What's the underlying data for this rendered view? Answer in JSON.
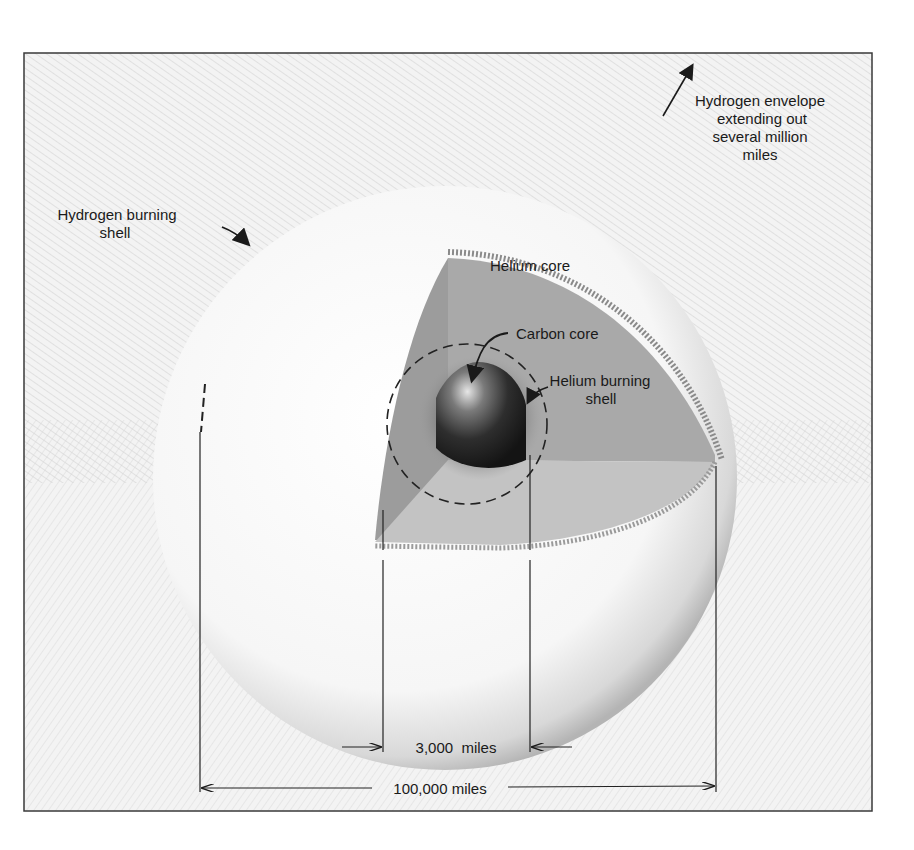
{
  "diagram": {
    "labels": {
      "hydrogen_envelope": [
        "Hydrogen envelope",
        "extending out",
        "several million",
        "miles"
      ],
      "hydrogen_shell": [
        "Hydrogen burning",
        "shell"
      ],
      "helium_core": "Helium core",
      "carbon_core": "Carbon core",
      "helium_shell": [
        "Helium burning",
        "shell"
      ]
    },
    "dimensions": {
      "inner": "3,000  miles",
      "outer": "100,000 miles"
    },
    "colors": {
      "frame": "#3a3a3a",
      "background": "#f4f4f4",
      "hatch": "#bdbdbd",
      "sphere_light": "#fafafa",
      "sphere_edge": "#a8a8a8",
      "cut_face_dark": "#9a9a9a",
      "cut_face_mid": "#aaaaaa",
      "cut_face_light": "#c2c2c2",
      "carbon_core": "#2b2b2b",
      "text": "#1a1a1a"
    }
  }
}
